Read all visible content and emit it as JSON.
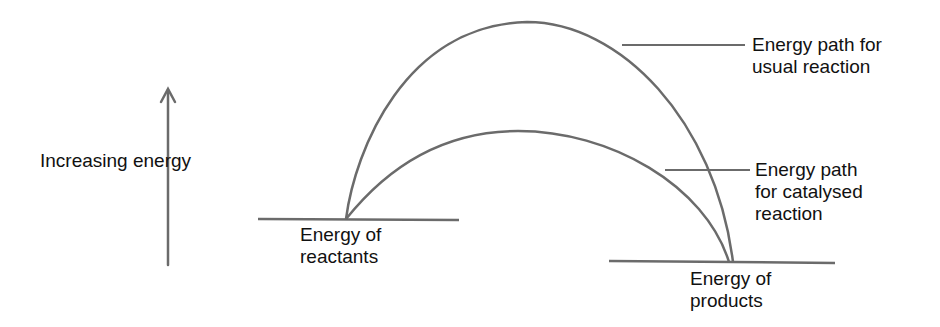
{
  "diagram": {
    "title": "",
    "axis_label": "Increasing energy",
    "labels": {
      "reactants": "Energy of\nreactants",
      "products": "Energy of\nproducts",
      "usual_path": "Energy path for\nusual reaction",
      "catalysed_path": "Energy path\nfor catalysed\nreaction"
    },
    "colors": {
      "line": "#6b6b6b",
      "text": "#111111",
      "background": "#ffffff"
    },
    "geometry": {
      "arrow": {
        "x": 168,
        "y_start": 265,
        "y_end": 88
      },
      "reactants_level": {
        "x1": 258,
        "x2": 459,
        "y": 219
      },
      "products_level": {
        "x1": 609,
        "x2": 835,
        "y": 262
      },
      "usual_curve": {
        "start": [
          346,
          219
        ],
        "peak": [
          527,
          22
        ],
        "end": [
          733,
          262
        ]
      },
      "catalysed_curve": {
        "start": [
          346,
          219
        ],
        "peak": [
          518,
          131
        ],
        "end": [
          729,
          262
        ]
      }
    }
  }
}
